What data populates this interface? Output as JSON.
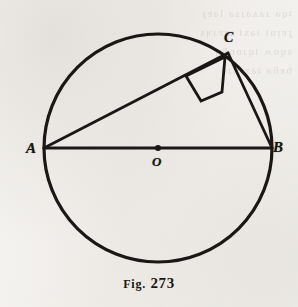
{
  "figure": {
    "caption_prefix": "Fig.",
    "caption_number": "273",
    "caption_full": "FIG. 273",
    "ink_color": "#1a1813",
    "paper_color": "#f3f1ee"
  },
  "labels": {
    "point_a": "A",
    "point_b": "B",
    "point_c": "C",
    "center_o": "O"
  },
  "ghost_show_through": {
    "line1": "ʇɥǝ ɹǝʌǝɹsǝ lǝɐɟ",
    "line2": "ɟɐᴉuʇ ʇǝxʇ ɯɐɹʞs",
    "line3": "sɥoʍ ʇɥɹonƃɥ",
    "line4": "bɐƃǝ ʇǝxʇnɹǝ"
  },
  "chart_data": {
    "type": "diagram",
    "title": "FIG. 273",
    "geometry": {
      "circle": {
        "cx": 158,
        "cy": 148,
        "r": 114,
        "stroke_width": 3.2
      },
      "points": [
        {
          "name": "A",
          "x": 44,
          "y": 148,
          "on": "circle"
        },
        {
          "name": "B",
          "x": 272,
          "y": 148,
          "on": "circle"
        },
        {
          "name": "C",
          "x": 228,
          "y": 53,
          "on": "circle"
        },
        {
          "name": "O",
          "x": 158,
          "y": 148,
          "on": "center"
        }
      ],
      "segments": [
        {
          "name": "AB",
          "from": "A",
          "to": "B",
          "role": "diameter"
        },
        {
          "name": "AC",
          "from": "A",
          "to": "C",
          "role": "chord"
        },
        {
          "name": "CB",
          "from": "C",
          "to": "B",
          "role": "chord"
        }
      ],
      "right_angle_marker": {
        "at": "C",
        "polygon": "225,57 186,76 201,101 222,92",
        "size": 30
      },
      "center_dot_radius": 3
    }
  }
}
